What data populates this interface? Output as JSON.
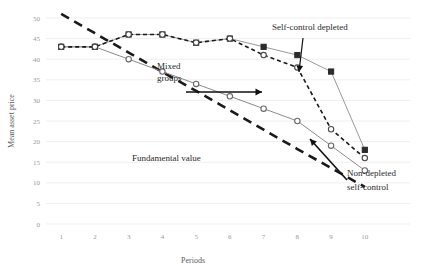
{
  "chart_data": {
    "type": "line",
    "title": "",
    "xlabel": "Periods",
    "ylabel": "Mean asset price",
    "x": [
      1,
      2,
      3,
      4,
      5,
      6,
      7,
      8,
      9,
      10
    ],
    "xticklabels": [
      "1",
      "2",
      "3",
      "4",
      "5",
      "6",
      "7",
      "8",
      "9",
      "10"
    ],
    "yticklabels": [
      "0",
      "5",
      "10",
      "15",
      "20",
      "25",
      "30",
      "35",
      "40",
      "45",
      "50"
    ],
    "ytickvalues": [
      0,
      5,
      10,
      15,
      20,
      25,
      30,
      35,
      40,
      45,
      50
    ],
    "xlim": [
      0.55,
      10.45
    ],
    "ylim": [
      0,
      50
    ],
    "grid": true,
    "legend": "none",
    "series": [
      {
        "name": "Self-control depleted",
        "marker": "filled-square",
        "linestyle": "solid",
        "color": "#9a9a9a",
        "marker_color": "#2b2b2b",
        "values": [
          43,
          43,
          46,
          46,
          44,
          45,
          43,
          41,
          37,
          18
        ]
      },
      {
        "name": "Mixed groups",
        "marker": "open-circle",
        "linestyle": "dashed",
        "color": "#1a1a1a",
        "marker_color": "#4a4a4a",
        "values": [
          43,
          43,
          46,
          46,
          44,
          45,
          41,
          38,
          23,
          16
        ]
      },
      {
        "name": "Non-depleted self-control",
        "marker": "open-circle",
        "linestyle": "solid",
        "color": "#8a8a8a",
        "marker_color": "#6a6a6a",
        "values": [
          43,
          43,
          40,
          37,
          34,
          31,
          28,
          25,
          19,
          13
        ]
      },
      {
        "name": "Fundamental value",
        "marker": "none",
        "linestyle": "heavy-dashed",
        "color": "#1a1a1a",
        "values": [
          51,
          46.3,
          41.6,
          36.9,
          32.3,
          27.6,
          22.9,
          18.2,
          13.6,
          9
        ]
      }
    ],
    "annotations": [
      {
        "id": "self-control-depleted",
        "text": "Self-control depleted",
        "target_x": 9,
        "target_y": 37
      },
      {
        "id": "mixed-groups",
        "text_line1": "Mixed",
        "text_line2": "groups",
        "target_x": 8,
        "target_y": 38
      },
      {
        "id": "fundamental-value",
        "text": "Fundamental value"
      },
      {
        "id": "non-depleted-self-control",
        "text_line1": "Non-depleted",
        "text_line2": "self-control",
        "target_x": 9,
        "target_y": 19
      }
    ]
  }
}
